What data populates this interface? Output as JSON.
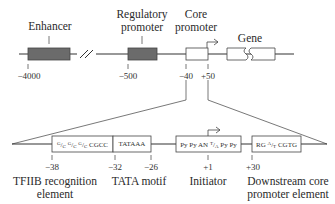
{
  "top_track": {
    "labels": {
      "enhancer": "Enhancer",
      "regulatory_promoter_line1": "Regulatory",
      "regulatory_promoter_line2": "promoter",
      "core_promoter_line1": "Core",
      "core_promoter_line2": "promoter",
      "gene": "Gene"
    },
    "positions": {
      "enhancer": "−4000",
      "regulatory": "−500",
      "core_start": "−40",
      "core_end": "+50"
    },
    "colors": {
      "element_fill": "#6b6b6b",
      "line": "#333333"
    }
  },
  "bottom_track": {
    "elements": [
      {
        "id": "bre",
        "seq_parts": [
          "G",
          "C",
          "G",
          "C",
          "G",
          "C",
          "CGCC"
        ],
        "seq_text": "G/C G/C G/C CGCC",
        "label_line1": "TFIIB recognition",
        "label_line2": "element"
      },
      {
        "id": "tata",
        "seq_text": "TATAAA",
        "label_line1": "TATA motif"
      },
      {
        "id": "inr",
        "seq_text_a": "Py Py AN",
        "seq_sup": "T",
        "seq_sub": "A",
        "seq_text_b": "Py Py",
        "label_line1": "Initiator"
      },
      {
        "id": "dpe",
        "seq_text_a": "RG",
        "seq_sup": "A",
        "seq_sub": "T",
        "seq_text_b": "CGTG",
        "label_line1": "Downstream core",
        "label_line2": "promoter element"
      }
    ],
    "positions": {
      "bre_start": "−38",
      "tata_start": "−32",
      "tata_end": "−26",
      "inr": "+1",
      "dpe": "+30"
    }
  }
}
